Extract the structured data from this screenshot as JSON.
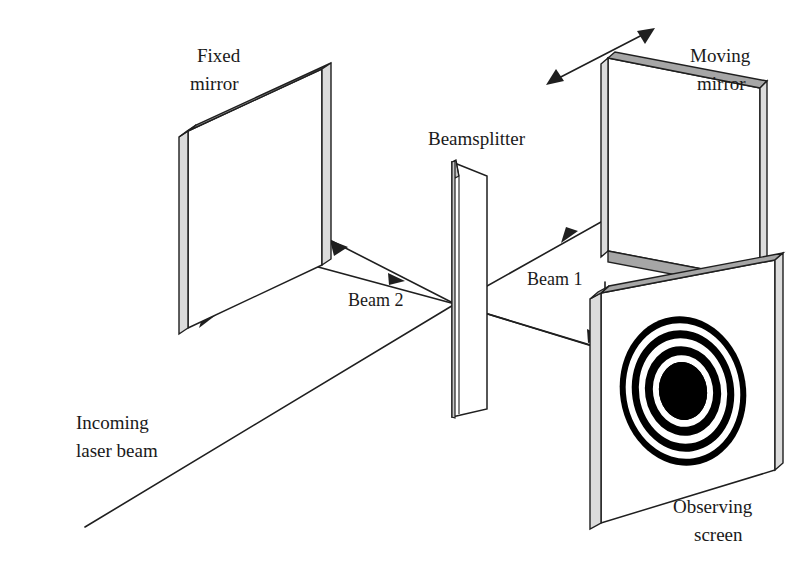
{
  "figure": {
    "type": "optics-schematic",
    "background_color": "#ffffff",
    "line_color": "#1f1f1f",
    "mirror_face_color": "#ffffff",
    "mirror_edge_color": "#a6a6a6",
    "fringe_dark_color": "#000000",
    "fringe_light_color": "#ffffff"
  },
  "labels": {
    "fixed_mirror_line1": "Fixed",
    "fixed_mirror_line2": "mirror",
    "beamsplitter": "Beamsplitter",
    "moving_mirror_line1": "Moving",
    "moving_mirror_line2": "mirror",
    "beam_1": "Beam 1",
    "beam_2": "Beam 2",
    "incoming_line1": "Incoming",
    "incoming_line2": "laser beam",
    "observing_line1": "Observing",
    "observing_line2": "screen"
  },
  "components": [
    {
      "name": "fixed-mirror",
      "label": "Fixed mirror",
      "role": "stationary reflecting surface in arm 2"
    },
    {
      "name": "beamsplitter",
      "label": "Beamsplitter",
      "role": "half-silvered plate dividing the incoming laser beam"
    },
    {
      "name": "moving-mirror",
      "label": "Moving mirror",
      "role": "translatable reflecting surface in arm 1"
    },
    {
      "name": "observing-screen",
      "label": "Observing screen",
      "role": "surface displaying circular interference fringes"
    }
  ],
  "beams": [
    {
      "name": "incoming-laser-beam",
      "label": "Incoming laser beam",
      "direction": "up-right toward beamsplitter"
    },
    {
      "name": "beam-2",
      "label": "Beam 2",
      "direction": "beamsplitter to fixed mirror and back"
    },
    {
      "name": "beam-1",
      "label": "Beam 1",
      "direction": "beamsplitter to moving mirror and back"
    },
    {
      "name": "output-beam",
      "label": "",
      "direction": "beamsplitter down-right to observing screen"
    }
  ],
  "fringe_pattern": {
    "name": "circular-interference-fringes",
    "center_x": 683,
    "center_y": 391,
    "ring_count": 4,
    "description": "concentric bright and dark circular fringes with dark center"
  },
  "motion_indicator": {
    "name": "moving-mirror-translation-arrow",
    "description": "double-headed arrow indicating mirror translation"
  }
}
